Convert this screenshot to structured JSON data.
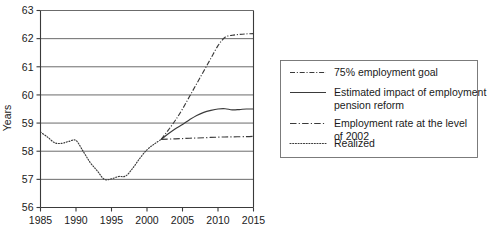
{
  "chart_data": {
    "type": "line",
    "title": "",
    "xlabel": "",
    "ylabel": "Years",
    "xlim": [
      1985,
      2015
    ],
    "ylim": [
      56,
      63
    ],
    "grid": true,
    "legend_position": "right",
    "xticks": [
      1985,
      1990,
      1995,
      2000,
      2005,
      2010,
      2015
    ],
    "yticks": [
      56,
      57,
      58,
      59,
      60,
      61,
      62,
      63
    ],
    "xtick_labels": [
      "1985",
      "1990",
      "1995",
      "2000",
      "2005",
      "2010",
      "2015"
    ],
    "ytick_labels": [
      "56",
      "57",
      "58",
      "59",
      "60",
      "61",
      "62",
      "63"
    ],
    "series": [
      {
        "name": "75% employment goal",
        "style": "dash-dot",
        "x": [
          2002,
          2003,
          2004,
          2005,
          2006,
          2007,
          2008,
          2009,
          2010,
          2011,
          2012,
          2013,
          2014,
          2015
        ],
        "values": [
          58.42,
          58.75,
          59.1,
          59.5,
          59.95,
          60.4,
          60.85,
          61.3,
          61.75,
          62.05,
          62.12,
          62.15,
          62.17,
          62.18
        ]
      },
      {
        "name": "Estimated impact of employment pension reform",
        "style": "solid",
        "x": [
          2002,
          2003,
          2004,
          2005,
          2006,
          2007,
          2008,
          2009,
          2010,
          2011,
          2012,
          2013,
          2014,
          2015
        ],
        "values": [
          58.42,
          58.62,
          58.8,
          58.95,
          59.12,
          59.27,
          59.38,
          59.45,
          59.5,
          59.51,
          59.47,
          59.48,
          59.5,
          59.5
        ]
      },
      {
        "name": "Employment rate at the level of 2002",
        "style": "long-dash-dot",
        "x": [
          2002,
          2004,
          2006,
          2008,
          2010,
          2012,
          2014,
          2015
        ],
        "values": [
          58.42,
          58.44,
          58.46,
          58.48,
          58.5,
          58.51,
          58.52,
          58.53
        ]
      },
      {
        "name": "Realized",
        "style": "dotted",
        "x": [
          1985,
          1986,
          1987,
          1988,
          1989,
          1990,
          1991,
          1992,
          1993,
          1994,
          1995,
          1996,
          1997,
          1998,
          1999,
          2000,
          2001,
          2002
        ],
        "values": [
          58.68,
          58.5,
          58.3,
          58.28,
          58.35,
          58.38,
          58.0,
          57.6,
          57.3,
          57.0,
          57.02,
          57.1,
          57.12,
          57.4,
          57.75,
          58.05,
          58.25,
          58.42
        ]
      }
    ]
  },
  "axes": {
    "ylabel": "Years"
  },
  "legend": {
    "items": [
      {
        "label": "75% employment goal",
        "style": "dash-dot"
      },
      {
        "label": "Estimated impact of employment",
        "label2": "pension reform",
        "style": "solid"
      },
      {
        "label": "Employment rate at the level",
        "label2": "of 2002",
        "style": "long-dash-dot"
      },
      {
        "label": "Realized",
        "style": "dotted"
      }
    ]
  }
}
